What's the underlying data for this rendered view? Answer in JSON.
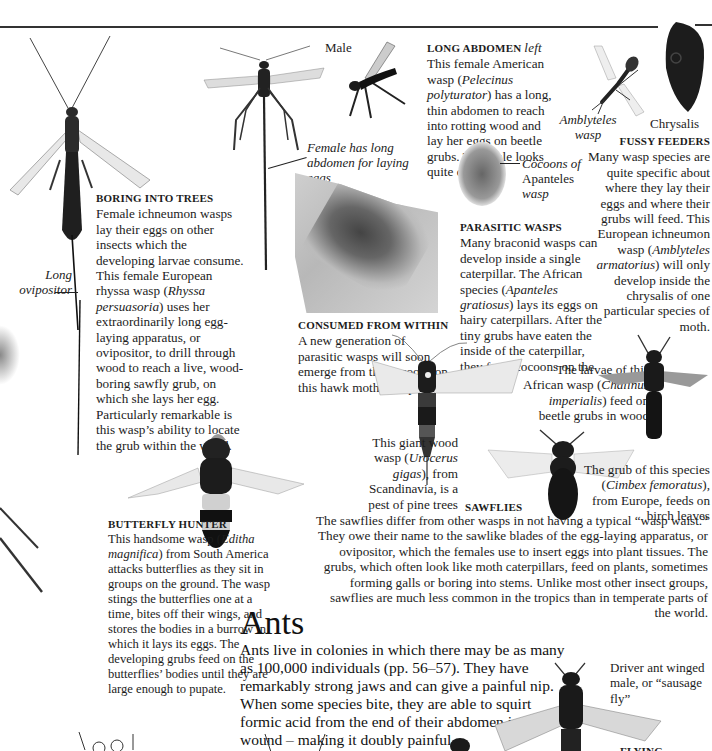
{
  "captions": {
    "male": "Male",
    "female_label": "Female has long abdomen for laying eggs",
    "long_ovipositor": "Long ovipositor",
    "amblyteles": "Amblyteles wasp",
    "chrysalis": "Chrysalis",
    "cocoons_line1": "Cocoons of",
    "cocoons_line2": "Apanteles",
    "cocoons_line3": "wasp",
    "driver_ant": "Driver ant winged male, or “sausage fly”"
  },
  "sections": {
    "boring": {
      "heading": "BORING INTO TREES",
      "body_1": "Female ichneumon wasps lay their eggs on other insects which the developing larvae consume. This female European rhyssa wasp (",
      "species": "Rhyssa persuasoria",
      "body_2": ") uses her extraordinarily long egg-laying apparatus, or ovipositor, to drill through wood to reach a live, wood-boring sawfly grub, on which she lays her egg. Particularly remarkable is this wasp’s ability to locate the grub within the wood."
    },
    "long_abdomen": {
      "heading": "LONG ABDOMEN",
      "heading_dir": "left",
      "body_1": "This female American wasp (",
      "species": "Pelecinus polyturator",
      "body_2": ") has a long, thin abdomen to reach into rotting wood and lay her eggs on beetle grubs. The male looks quite different."
    },
    "fussy": {
      "heading": "FUSSY FEEDERS",
      "body_1": "Many wasp species are quite specific about where they lay their eggs and where their grubs will feed. This European ichneumon wasp (",
      "species": "Amblyteles armatorius",
      "body_2": ") will only develop inside the chrysalis of one particular species of moth."
    },
    "parasitic": {
      "heading": "PARASITIC WASPS",
      "body_1": "Many braconid wasps can develop inside a single caterpillar. The African species (",
      "species": "Apanteles gratiosus",
      "body_2": ") lays its eggs on hairy caterpillars. After the tiny grubs have eaten the inside of the caterpillar, they form cocoons on the surface."
    },
    "consumed": {
      "heading": "CONSUMED FROM WITHIN",
      "body": "A new generation of parasitic wasps will soon emerge from the cocoons on this hawk moth caterpillar."
    },
    "chalinus": {
      "body_1": "The larvae of this African wasp (",
      "species": "Chalinus imperialis",
      "body_2": ") feed on beetle grubs in wood"
    },
    "urocerus": {
      "body_1": "This giant wood wasp (",
      "species": "Urocerus gigas",
      "body_2": "), from Scandinavia, is a pest of pine trees"
    },
    "cimbex": {
      "body_1": "The grub of this species (",
      "species": "Cimbex femoratus",
      "body_2": "), from Europe, feeds on birch leaves"
    },
    "sawflies": {
      "heading": "SAWFLIES",
      "body": "The sawflies differ from other wasps in not having a typical “wasp waist.” They owe their name to the sawlike blades of the egg-laying apparatus, or ovipositor, which the females use to insert eggs into plant tissues. The grubs, which often look like moth caterpillars, feed on plants, sometimes forming galls or boring into stems. Unlike most other insect groups, sawflies are much less common in the tropics than in temperate parts of the world."
    },
    "butterfly_hunter": {
      "heading": "BUTTERFLY HUNTER",
      "body_1": "This handsome wasp (",
      "species": "Editha magnifica",
      "body_2": ") from South America attacks butterflies as they sit in groups on the ground. The wasp stings the butterflies one at a time, bites off their wings, and stores the bodies in a burrow in which it lays its eggs. The developing grubs feed on the butterflies’ bodies until they are large enough to pupate."
    },
    "ants": {
      "title": "Ants",
      "body": "Ants live in colonies in which there may be as many as 100,000 individuals (pp. 56–57). They have remarkably strong jaws and can give a painful nip. When some species bite, they are able to squirt formic acid from the end of their abdomen into the wound – making it doubly painful."
    },
    "flying_sausages": {
      "heading": "FLYING SAUSAGES"
    }
  },
  "images": [
    "rhyssa-wasp",
    "pelecinus-female",
    "pelecinus-male",
    "amblyteles-wasp",
    "chrysalis",
    "apanteles-cocoons",
    "hawk-moth-caterpillar",
    "urocerus-wasp",
    "chalinus-wasp",
    "cimbex-sawfly",
    "editha-wasp",
    "driver-ant"
  ]
}
